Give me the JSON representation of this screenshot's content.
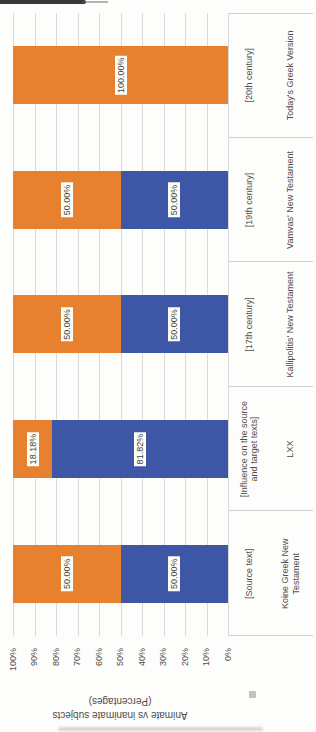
{
  "chart_data": {
    "type": "bar",
    "subtype": "stacked-100-percent",
    "rendered_rotation_deg": -90,
    "title": "",
    "ylabel": "Animate vs inanimate subjects (Percentages)",
    "ylabel_lines": [
      "Animate vs inanimate subjects",
      "(Percentages)"
    ],
    "ylim": [
      0,
      100
    ],
    "grid": true,
    "ytick_labels": [
      "100%",
      "90%",
      "80%",
      "70%",
      "60%",
      "50%",
      "40%",
      "30%",
      "20%",
      "10%",
      "0%"
    ],
    "categories": [
      {
        "group": "[Source text]",
        "group_lines": [
          "[Source text]"
        ],
        "name": "Koine Greek New Testament",
        "name_lines": [
          "Koine Greek New",
          "Testament"
        ]
      },
      {
        "group": "[Influence on the source and target texts]",
        "group_lines": [
          "[Influence on the source",
          "and target texts]"
        ],
        "name": "LXX",
        "name_lines": [
          "LXX"
        ]
      },
      {
        "group": "[17th century]",
        "group_lines": [
          "[17th century]"
        ],
        "name": "Kallipolitis' New Testament",
        "name_lines": [
          "Kallipolitis' New Testament"
        ]
      },
      {
        "group": "[19th century]",
        "group_lines": [
          "[19th century]"
        ],
        "name": "Vamvas' New Testament",
        "name_lines": [
          "Vamvas' New Testament"
        ]
      },
      {
        "group": "[20th century]",
        "group_lines": [
          "[20th century]"
        ],
        "name": "Today's Greek Version",
        "name_lines": [
          "Today's Greek Version"
        ]
      }
    ],
    "series": [
      {
        "name": "blue-bottom-segment",
        "color": "#3D56A5",
        "values": [
          50,
          81.82,
          50,
          50,
          0
        ],
        "labels": [
          "50.00%",
          "81.82%",
          "50.00%",
          "50.00%",
          "0.00%"
        ]
      },
      {
        "name": "orange-top-segment",
        "color": "#E8812F",
        "values": [
          50,
          18.18,
          50,
          50,
          100
        ],
        "labels": [
          "50.00%",
          "18.18%",
          "50.00%",
          "50.00%",
          "100.00%"
        ]
      }
    ],
    "colors": {
      "gridline": "#DADADA",
      "axis_line": "#C4C4C4",
      "axis_text": "#4D4D4D",
      "data_label_bg": "#FDFDF7",
      "data_label_text": "#3F3F3F"
    },
    "legend": "none"
  }
}
